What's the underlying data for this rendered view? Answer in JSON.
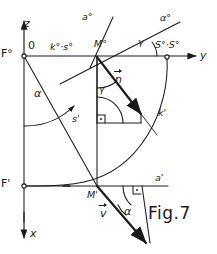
{
  "figure": {
    "caption": "Fig.7",
    "axes": {
      "z_label": "z",
      "x_label": "x",
      "y_label": "y",
      "origin_label": "0"
    },
    "points": {
      "f_top": "F°",
      "f_bottom": "F'",
      "m_top": "M°",
      "m_bottom": "M'",
      "s_top": "S°·S°"
    },
    "curves": {
      "k_s_top": "k°·s°",
      "s_front": "s'",
      "k_front": "k'",
      "a_top": "a°",
      "a_front": "a'",
      "alpha_top": "α°"
    },
    "vectors": {
      "normal": "n",
      "velocity": "v"
    },
    "angles": {
      "alpha_upper": "α",
      "alpha_lower": "α",
      "gamma_upper": "γ",
      "gamma_lower": "γ"
    },
    "colors": {
      "ink": "#1a1a1a",
      "background": "#ffffff"
    }
  }
}
